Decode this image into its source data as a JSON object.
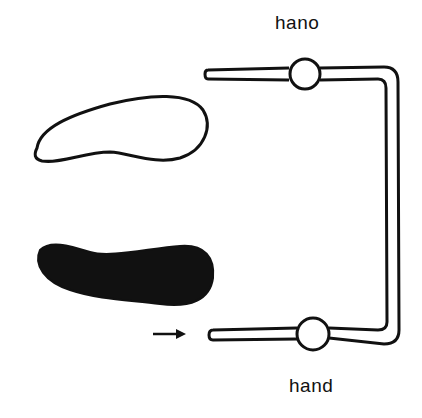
{
  "diagram": {
    "labels": {
      "top_hand": "hano",
      "bottom_hand": "hand"
    },
    "shapes": {
      "outline_blob": "outlined kidney-shaped figure",
      "filled_blob": "filled black kidney-shaped figure"
    },
    "icons": {
      "arrow": "right-arrow-icon"
    },
    "colors": {
      "ink": "#111111",
      "background": "#ffffff"
    }
  }
}
